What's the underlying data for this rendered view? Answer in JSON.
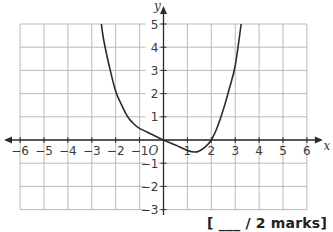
{
  "chart_data": {
    "type": "line",
    "title": "",
    "xlabel": "x",
    "ylabel": "y",
    "xlim": [
      -6,
      6
    ],
    "ylim": [
      -3,
      5
    ],
    "grid": true,
    "origin_label": "O",
    "x_ticks": [
      -6,
      -5,
      -4,
      -3,
      -2,
      -1,
      1,
      2,
      3,
      4,
      5,
      6
    ],
    "x_tick_labels": [
      "−6",
      "−5",
      "−4",
      "−3",
      "−2",
      "−1",
      "1",
      "2",
      "3",
      "4",
      "5",
      "6"
    ],
    "y_ticks": [
      -3,
      -2,
      -1,
      1,
      2,
      3,
      4,
      5
    ],
    "y_tick_labels": [
      "−3",
      "−2",
      "−1",
      "1",
      "2",
      "3",
      "4",
      "5"
    ],
    "series": [
      {
        "name": "curve",
        "x": [
          -2.6,
          -2.5,
          -2.25,
          -2,
          -1.75,
          -1.5,
          -1.25,
          -1,
          -0.5,
          0,
          0.5,
          1,
          1.3,
          1.5,
          1.75,
          2,
          2.25,
          2.5,
          2.75,
          3,
          3.25
        ],
        "y": [
          5,
          4.3,
          3.1,
          2.1,
          1.5,
          1.0,
          0.7,
          0.5,
          0.25,
          0,
          -0.22,
          -0.45,
          -0.52,
          -0.47,
          -0.3,
          0,
          0.55,
          1.3,
          2.2,
          3.2,
          5
        ]
      }
    ]
  },
  "footer": {
    "marks_label": "[ ___ / 2 marks]"
  }
}
